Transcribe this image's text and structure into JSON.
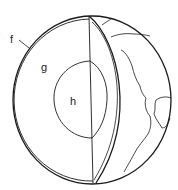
{
  "diagram": {
    "labels": {
      "f": "f",
      "g": "g",
      "h": "h"
    },
    "colors": {
      "line": "#1a1a1a",
      "background": "#ffffff"
    }
  }
}
